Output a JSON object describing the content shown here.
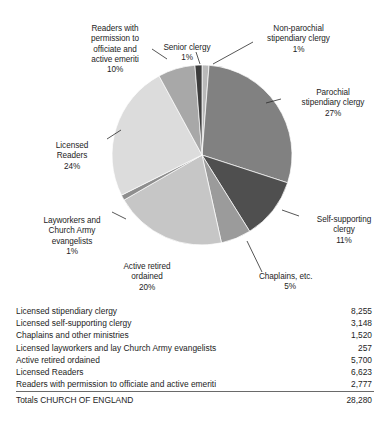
{
  "chart_data": {
    "type": "pie",
    "title": "",
    "subtitle": "",
    "xlabel": "",
    "ylabel": "",
    "legend_position": "none",
    "grid": false,
    "units": "percent",
    "categories": [
      "Non-parochial stipendiary clergy",
      "Parochial stipendiary clergy",
      "Self-supporting clergy",
      "Chaplains, etc.",
      "Active retired ordained",
      "Layworkers and Church Army evangelists",
      "Licensed Readers",
      "Readers with permission to officiate and active emeriti",
      "Senior clergy"
    ],
    "values": [
      1,
      27,
      11,
      5,
      20,
      1,
      24,
      10,
      1
    ],
    "slices": [
      {
        "label": "Non-parochial stipendiary clergy",
        "value": 1,
        "pct_text": "1%",
        "color": "#b9b9b9",
        "start_deg": 0,
        "end_deg": 4.5
      },
      {
        "label": "Parochial stipendiary clergy",
        "value": 27,
        "pct_text": "27%",
        "color": "#818181",
        "start_deg": 4.5,
        "end_deg": 108.0
      },
      {
        "label": "Self-supporting clergy",
        "value": 11,
        "pct_text": "11%",
        "color": "#4f4f4f",
        "start_deg": 108.0,
        "end_deg": 148.0
      },
      {
        "label": "Chaplains, etc.",
        "value": 5,
        "pct_text": "5%",
        "color": "#9b9b9b",
        "start_deg": 148.0,
        "end_deg": 167.5
      },
      {
        "label": "Active retired ordained",
        "value": 20,
        "pct_text": "20%",
        "color": "#c6c6c6",
        "start_deg": 167.5,
        "end_deg": 240.0
      },
      {
        "label": "Layworkers and Church Army evangelists",
        "value": 1,
        "pct_text": "1%",
        "color": "#8e8e8e",
        "start_deg": 240.0,
        "end_deg": 243.5
      },
      {
        "label": "Licensed Readers",
        "value": 24,
        "pct_text": "24%",
        "color": "#dcdcdc",
        "start_deg": 243.5,
        "end_deg": 331.5
      },
      {
        "label": "Readers with permission to officiate and active emeriti",
        "value": 10,
        "pct_text": "10%",
        "color": "#a8a8a8",
        "start_deg": 331.5,
        "end_deg": 355.5
      },
      {
        "label": "Senior clergy",
        "value": 1,
        "pct_text": "1%",
        "color": "#3c3c3c",
        "start_deg": 355.5,
        "end_deg": 360.0
      }
    ],
    "table": {
      "rows": [
        {
          "label": "Licensed stipendiary clergy",
          "value": "8,255"
        },
        {
          "label": "Licensed self-supporting clergy",
          "value": "3,148"
        },
        {
          "label": "Chaplains and other ministries",
          "value": "1,520"
        },
        {
          "label": "Licensed layworkers and lay Church Army evangelists",
          "value": "257"
        },
        {
          "label": "Active retired ordained",
          "value": "5,700"
        },
        {
          "label": "Licensed Readers",
          "value": "6,623"
        },
        {
          "label": "Readers with permission to officiate and active emeriti",
          "value": "2,777"
        }
      ],
      "totals": {
        "label": "Totals CHURCH OF ENGLAND",
        "value": "28,280"
      }
    }
  },
  "labels": {
    "readers_permission": {
      "name": "Readers with\npermission to\nofficiate and\nactive emeriti",
      "pct": "10%"
    },
    "senior_clergy": {
      "name": "Senior clergy",
      "pct": "1%"
    },
    "non_parochial": {
      "name": "Non-parochial\nstipendiary clergy",
      "pct": "1%"
    },
    "parochial": {
      "name": "Parochial\nstipendiary clergy",
      "pct": "27%"
    },
    "self_supporting": {
      "name": "Self-supporting\nclergy",
      "pct": "11%"
    },
    "chaplains": {
      "name": "Chaplains, etc.",
      "pct": "5%"
    },
    "active_retired": {
      "name": "Active retired\nordained",
      "pct": "20%"
    },
    "layworkers": {
      "name": "Layworkers and\nChurch Army\nevangelists",
      "pct": "1%"
    },
    "licensed_readers": {
      "name": "Licensed\nReaders",
      "pct": "24%"
    }
  }
}
